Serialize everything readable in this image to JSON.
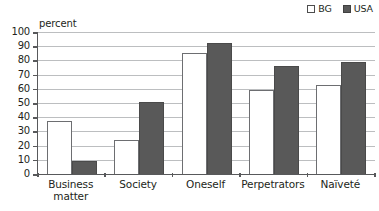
{
  "chart_data": {
    "type": "bar",
    "title": "",
    "subtitle": "",
    "xlabel": "",
    "ylabel": "percent",
    "ylim": [
      0,
      100
    ],
    "ytick_step": 10,
    "yticks": [
      100,
      90,
      80,
      70,
      60,
      50,
      40,
      30,
      20,
      10,
      0
    ],
    "grid": true,
    "legend_position": "top-right",
    "categories": [
      "Business\nmatter",
      "Society",
      "Oneself",
      "Perpetrators",
      "Naïveté"
    ],
    "series": [
      {
        "name": "BG",
        "color": "#ffffff",
        "values": [
          37,
          24,
          85,
          59,
          63
        ]
      },
      {
        "name": "USA",
        "color": "#595959",
        "values": [
          9,
          51,
          92,
          76,
          79
        ]
      }
    ]
  },
  "legend": {
    "entries": [
      {
        "label": "BG",
        "swatch": "empty-square-icon"
      },
      {
        "label": "USA",
        "swatch": "filled-square-icon"
      }
    ]
  },
  "axis": {
    "y_title": "percent"
  },
  "colors": {
    "bar_bg_fill": "#ffffff",
    "bar_bg_stroke": "#6d6e71",
    "bar_usa_fill": "#595959",
    "bar_usa_stroke": "#4a4a4a",
    "gridline": "#bcbec0",
    "axis": "#58595b",
    "text": "#231f20"
  }
}
